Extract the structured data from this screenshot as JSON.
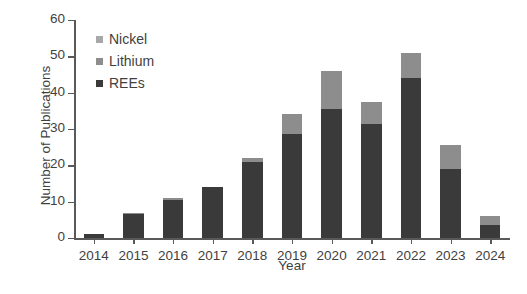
{
  "chart_data": {
    "type": "bar",
    "barmode": "stacked",
    "title": "",
    "xlabel": "Year",
    "ylabel": "Number of Publications",
    "categories": [
      "2014",
      "2015",
      "2016",
      "2017",
      "2018",
      "2019",
      "2020",
      "2021",
      "2022",
      "2023",
      "2024"
    ],
    "series": [
      {
        "name": "REEs",
        "color": "#3a3a3a",
        "values": [
          1,
          6.5,
          10.5,
          14,
          21,
          28.5,
          35.5,
          31.5,
          44,
          19,
          3.5
        ]
      },
      {
        "name": "Lithium",
        "color": "#8d8d8d",
        "values": [
          0,
          0.5,
          0.5,
          0,
          1,
          5.5,
          10.5,
          6,
          7,
          6.5,
          2.5
        ]
      },
      {
        "name": "Nickel",
        "color": "#a8a8a8",
        "values": [
          0,
          0,
          0,
          0,
          0,
          0,
          0,
          0,
          0,
          0,
          0
        ]
      }
    ],
    "totals": [
      1,
      7,
      11,
      14,
      22,
      34,
      46,
      37.5,
      51,
      25.5,
      6
    ],
    "ylim": [
      0,
      60
    ],
    "yticks": [
      0,
      10,
      20,
      30,
      40,
      50,
      60
    ],
    "ytick_labels": [
      "0",
      "10",
      "20",
      "30",
      "40",
      "50",
      "60"
    ],
    "grid": false,
    "legend_position": "top-left",
    "legend_order": [
      "Nickel",
      "Lithium",
      "REEs"
    ]
  },
  "axis": {
    "y_title": "Number of Publications",
    "x_title": "Year"
  },
  "colors": {
    "axis": "#595959",
    "text": "#3f3f3f",
    "background": "#ffffff"
  }
}
